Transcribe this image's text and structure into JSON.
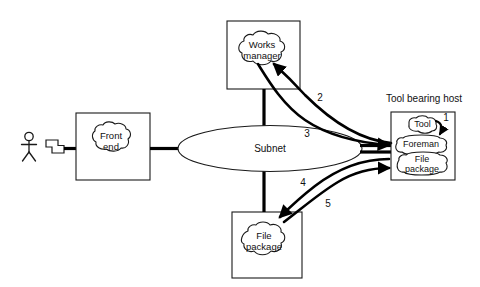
{
  "diagram": {
    "actor": {
      "name": "user-actor",
      "terminal": "terminal"
    },
    "boxes": {
      "front_end": {
        "label_line1": "Front",
        "label_line2": "end"
      },
      "works_manager": {
        "label_line1": "Works",
        "label_line2": "manager"
      },
      "file_package_remote": {
        "label_line1": "File",
        "label_line2": "package"
      },
      "tool_bearing_host": {
        "title": "Tool bearing host",
        "tool": "Tool",
        "foreman": "Foreman",
        "file_package_line1": "File",
        "file_package_line2": "package"
      }
    },
    "network": {
      "subnet_label": "Subnet"
    },
    "flow_labels": {
      "one": "1",
      "two": "2",
      "three": "3",
      "four": "4",
      "five": "5"
    },
    "colors": {
      "stroke": "#1a1a1a",
      "flow": "#000000",
      "background": "#ffffff"
    }
  }
}
